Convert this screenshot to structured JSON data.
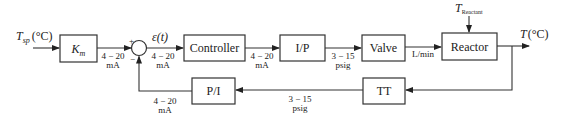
{
  "diagram": {
    "type": "feedback-control-block-diagram",
    "input": {
      "symbol": "T",
      "subscript": "sp",
      "unit": "(°C)"
    },
    "output": {
      "symbol": "T",
      "unit": "(°C)"
    },
    "disturbance": {
      "symbol": "T",
      "subscript": "Reactant"
    },
    "blocks": {
      "km": {
        "symbol": "K",
        "subscript": "m"
      },
      "controller": {
        "label": "Controller"
      },
      "ip": {
        "label": "I/P"
      },
      "valve": {
        "label": "Valve"
      },
      "reactor": {
        "label": "Reactor"
      },
      "tt": {
        "label": "TT"
      },
      "pi": {
        "label": "P/I"
      }
    },
    "summing_junction": {
      "plus": "+",
      "minus": "−",
      "error_label": "ε(t)"
    },
    "signals": {
      "km_to_sum": {
        "line1": "4 − 20",
        "line2": "mA"
      },
      "controller_in": {
        "line1": "4 − 20",
        "line2": "mA"
      },
      "controller_to_ip": {
        "line1": "4 − 20",
        "line2": "mA"
      },
      "ip_to_valve": {
        "line1": "3 − 15",
        "line2": "psig"
      },
      "valve_to_reactor": {
        "line1": "L/min"
      },
      "tt_to_pi": {
        "line1": "3 − 15",
        "line2": "psig"
      },
      "pi_to_sum": {
        "line1": "4 − 20",
        "line2": "mA"
      }
    }
  }
}
